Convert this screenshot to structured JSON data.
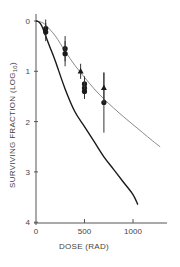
{
  "chart_data": {
    "type": "line",
    "title": "",
    "xlabel": "DOSE (RAD)",
    "ylabel": "SURVIVING FRACTION (LOG10)",
    "xlim": [
      0,
      1300
    ],
    "ylim": [
      0,
      4
    ],
    "y_inverted": true,
    "grid": false,
    "legend": null,
    "x_ticks": [
      0,
      500,
      1000
    ],
    "x_tick_labels": [
      "0",
      "500",
      "1000"
    ],
    "y_ticks": [
      0,
      1,
      2,
      3,
      4
    ],
    "y_tick_labels": [
      "0",
      "1",
      "2",
      "3",
      "4"
    ],
    "series": [
      {
        "name": "upper fitted curve (gray)",
        "style": "line",
        "color": "#8a8a8a",
        "x": [
          0,
          50,
          100,
          200,
          300,
          400,
          500,
          600,
          700,
          800,
          900,
          1000,
          1100,
          1200,
          1280
        ],
        "y": [
          0,
          0.02,
          0.08,
          0.3,
          0.6,
          0.88,
          1.12,
          1.35,
          1.55,
          1.73,
          1.9,
          2.06,
          2.22,
          2.38,
          2.5
        ]
      },
      {
        "name": "lower fitted curve (black)",
        "style": "line",
        "color": "#1a1a1a",
        "x": [
          0,
          30,
          60,
          100,
          150,
          200,
          300,
          400,
          500,
          600,
          700,
          800,
          900,
          1000,
          1050
        ],
        "y": [
          0,
          0.02,
          0.1,
          0.3,
          0.55,
          0.8,
          1.35,
          1.8,
          2.1,
          2.4,
          2.7,
          2.95,
          3.2,
          3.45,
          3.65
        ]
      },
      {
        "name": "circles",
        "style": "marker-circle",
        "color": "#1a1a1a",
        "x": [
          100,
          100,
          300,
          300,
          500,
          500,
          500,
          700
        ],
        "y": [
          0.15,
          0.22,
          0.55,
          0.65,
          1.25,
          1.33,
          1.4,
          1.62
        ],
        "err_low": [
          0.18,
          0.18,
          0.25,
          0.25,
          0.15,
          0.15,
          0.15,
          0.6
        ],
        "err_high": [
          0.18,
          0.18,
          0.25,
          0.25,
          0.15,
          0.15,
          0.15,
          0.6
        ]
      },
      {
        "name": "triangles",
        "style": "marker-triangle",
        "color": "#1a1a1a",
        "x": [
          460,
          700
        ],
        "y": [
          1.0,
          1.33
        ],
        "err_low": [
          0.15,
          0.3
        ],
        "err_high": [
          0.15,
          0.3
        ]
      }
    ]
  },
  "labels": {
    "xlabel": "DOSE (RAD)",
    "ylabel_main": "SURVIVING FRACTION (LOG",
    "ylabel_sub": "10",
    "ylabel_close": ")"
  }
}
